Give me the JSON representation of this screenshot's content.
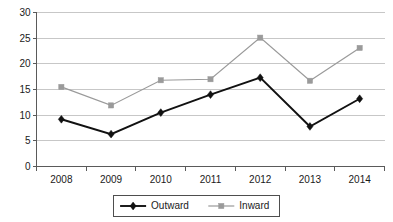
{
  "chart_data": {
    "type": "line",
    "title": "",
    "subtitle": "",
    "xlabel": "",
    "ylabel": "",
    "categories": [
      "2008",
      "2009",
      "2010",
      "2011",
      "2012",
      "2013",
      "2014"
    ],
    "series": [
      {
        "name": "Outward",
        "color": "#111111",
        "marker": "diamond",
        "values": [
          9.2,
          6.3,
          10.5,
          14.0,
          17.3,
          7.8,
          13.2
        ]
      },
      {
        "name": "Inward",
        "color": "#9a9a9a",
        "marker": "square",
        "values": [
          15.5,
          11.9,
          16.8,
          17.0,
          25.1,
          16.7,
          23.1
        ]
      }
    ],
    "ylim": [
      0,
      30
    ],
    "yticks": [
      0,
      5,
      10,
      15,
      20,
      25,
      30
    ],
    "ytick_labels": [
      "0",
      "5",
      "10",
      "15",
      "20",
      "25",
      "30"
    ],
    "grid": true,
    "grid_axis": "y",
    "legend_position": "bottom-center",
    "legend_entries": [
      {
        "label": "Outward",
        "color": "#111111",
        "marker": "diamond"
      },
      {
        "label": "Inward",
        "color": "#9a9a9a",
        "marker": "square"
      }
    ]
  },
  "colors": {
    "background": "#ffffff",
    "gridline": "#b9b9b9",
    "axis": "#5a5a5a",
    "text": "#1a1a1a",
    "outward": "#111111",
    "inward": "#9a9a9a"
  }
}
